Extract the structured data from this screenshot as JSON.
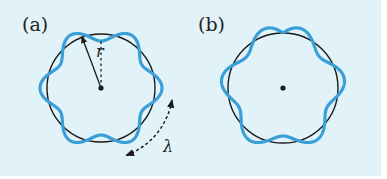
{
  "figure": {
    "background": "#e1f2f9",
    "wave_color": "#3a9fd8",
    "circle_color": "#1a1a1a",
    "panels": [
      {
        "id": "a",
        "label": "(a)",
        "label_pos": [
          22,
          31
        ],
        "center": [
          101,
          88
        ],
        "radius": 54,
        "wave": {
          "wavelengths": 6,
          "amplitude": 7,
          "phase_deg": 0,
          "closed": true
        },
        "radius_label": "r",
        "radius_label_pos": [
          96,
          57
        ],
        "radius_end": [
          82,
          37
        ],
        "dashed_ref_end": [
          101,
          40
        ],
        "wavelength_label": "λ",
        "wavelength_label_pos": [
          163,
          152
        ],
        "wavelength_arrow": {
          "radius": 72,
          "start_deg": 10,
          "end_deg": 69
        }
      },
      {
        "id": "b",
        "label": "(b)",
        "label_pos": [
          198,
          31
        ],
        "center": [
          283,
          88
        ],
        "radius": 55,
        "wave": {
          "wavelengths": 5.5,
          "amplitude": 7,
          "start_deg": -90,
          "closed": false
        }
      }
    ]
  }
}
